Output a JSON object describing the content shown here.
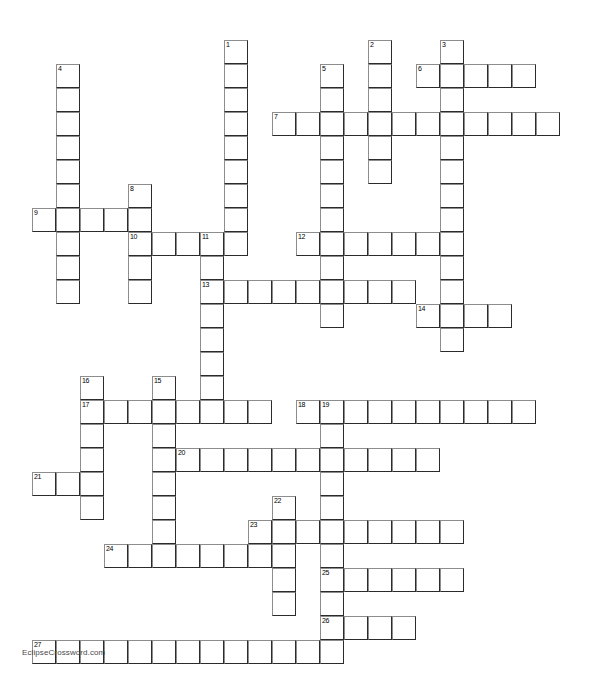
{
  "puzzle": {
    "title": "Crossword Puzzle Grid",
    "watermark": "EclipseCrossword.com",
    "cell_size": 24,
    "origin_x": 32,
    "origin_y": 40,
    "columns": 24,
    "rows": 27,
    "colors": {
      "background": "#ffffff",
      "cell_fill": "#ffffff",
      "cell_border_dark": "#2b2b2b",
      "cell_border_light": "#8d8d8d",
      "number_text": "#000000",
      "watermark_text": "#4a4a4a"
    },
    "entries": [
      {
        "number": 1,
        "direction": "down",
        "col": 8,
        "row": 0,
        "length": 9
      },
      {
        "number": 2,
        "direction": "down",
        "col": 14,
        "row": 0,
        "length": 8
      },
      {
        "number": 3,
        "direction": "down",
        "col": 17,
        "row": 0,
        "length": 11
      },
      {
        "number": 4,
        "direction": "down",
        "col": 1,
        "row": 1,
        "length": 10
      },
      {
        "number": 5,
        "direction": "down",
        "col": 12,
        "row": 1,
        "length": 8
      },
      {
        "number": 6,
        "direction": "across",
        "col": 16,
        "row": 1,
        "length": 5
      },
      {
        "number": 7,
        "direction": "across",
        "col": 10,
        "row": 3,
        "length": 12
      },
      {
        "number": 8,
        "direction": "down",
        "col": 4,
        "row": 6,
        "length": 5
      },
      {
        "number": 9,
        "direction": "across",
        "col": 0,
        "row": 7,
        "length": 5
      },
      {
        "number": 10,
        "direction": "across",
        "col": 4,
        "row": 8,
        "length": 4
      },
      {
        "number": 11,
        "direction": "down",
        "col": 7,
        "row": 8,
        "length": 3
      },
      {
        "number": 12,
        "direction": "across",
        "col": 11,
        "row": 8,
        "length": 7
      },
      {
        "number": 13,
        "direction": "across",
        "col": 7,
        "row": 10,
        "length": 9
      },
      {
        "number": 13,
        "direction": "down",
        "col": 7,
        "row": 10,
        "length": 7
      },
      {
        "number": 14,
        "direction": "across",
        "col": 16,
        "row": 11,
        "length": 4
      },
      {
        "number": 15,
        "direction": "down",
        "col": 5,
        "row": 14,
        "length": 9
      },
      {
        "number": 16,
        "direction": "down",
        "col": 2,
        "row": 14,
        "length": 6
      },
      {
        "number": 17,
        "direction": "across",
        "col": 2,
        "row": 15,
        "length": 8
      },
      {
        "number": 18,
        "direction": "across",
        "col": 11,
        "row": 15,
        "length": 10
      },
      {
        "number": 19,
        "direction": "down",
        "col": 12,
        "row": 15,
        "length": 4
      },
      {
        "number": 20,
        "direction": "across",
        "col": 6,
        "row": 17,
        "length": 11
      },
      {
        "number": 21,
        "direction": "across",
        "col": 0,
        "row": 18,
        "length": 3
      },
      {
        "number": 22,
        "direction": "down",
        "col": 10,
        "row": 19,
        "length": 5
      },
      {
        "number": 23,
        "direction": "across",
        "col": 9,
        "row": 20,
        "length": 9
      },
      {
        "number": 24,
        "direction": "across",
        "col": 3,
        "row": 21,
        "length": 7
      },
      {
        "number": 25,
        "direction": "across",
        "col": 12,
        "row": 22,
        "length": 6
      },
      {
        "number": 26,
        "direction": "across",
        "col": 12,
        "row": 24,
        "length": 4
      },
      {
        "number": 27,
        "direction": "across",
        "col": 0,
        "row": 25,
        "length": 13
      }
    ],
    "cells": [
      {
        "col": 8,
        "row": 0,
        "number": "1"
      },
      {
        "col": 14,
        "row": 0,
        "number": "2"
      },
      {
        "col": 17,
        "row": 0,
        "number": "3"
      },
      {
        "col": 8,
        "row": 1
      },
      {
        "col": 14,
        "row": 1
      },
      {
        "col": 1,
        "row": 1,
        "number": "4"
      },
      {
        "col": 12,
        "row": 1,
        "number": "5"
      },
      {
        "col": 16,
        "row": 1,
        "number": "6"
      },
      {
        "col": 17,
        "row": 1
      },
      {
        "col": 18,
        "row": 1
      },
      {
        "col": 19,
        "row": 1
      },
      {
        "col": 20,
        "row": 1
      },
      {
        "col": 1,
        "row": 2
      },
      {
        "col": 8,
        "row": 2
      },
      {
        "col": 12,
        "row": 2
      },
      {
        "col": 14,
        "row": 2
      },
      {
        "col": 17,
        "row": 2
      },
      {
        "col": 10,
        "row": 3,
        "number": "7"
      },
      {
        "col": 11,
        "row": 3
      },
      {
        "col": 12,
        "row": 3
      },
      {
        "col": 13,
        "row": 3
      },
      {
        "col": 14,
        "row": 3
      },
      {
        "col": 15,
        "row": 3
      },
      {
        "col": 16,
        "row": 3
      },
      {
        "col": 17,
        "row": 3
      },
      {
        "col": 18,
        "row": 3
      },
      {
        "col": 19,
        "row": 3
      },
      {
        "col": 20,
        "row": 3
      },
      {
        "col": 21,
        "row": 3
      },
      {
        "col": 1,
        "row": 3
      },
      {
        "col": 8,
        "row": 3
      },
      {
        "col": 1,
        "row": 4
      },
      {
        "col": 8,
        "row": 4
      },
      {
        "col": 12,
        "row": 4
      },
      {
        "col": 14,
        "row": 4
      },
      {
        "col": 17,
        "row": 4
      },
      {
        "col": 1,
        "row": 5
      },
      {
        "col": 8,
        "row": 5
      },
      {
        "col": 12,
        "row": 5
      },
      {
        "col": 14,
        "row": 5
      },
      {
        "col": 17,
        "row": 5
      },
      {
        "col": 1,
        "row": 6
      },
      {
        "col": 4,
        "row": 6,
        "number": "8"
      },
      {
        "col": 8,
        "row": 6
      },
      {
        "col": 12,
        "row": 6
      },
      {
        "col": 17,
        "row": 6
      },
      {
        "col": 0,
        "row": 7,
        "number": "9"
      },
      {
        "col": 1,
        "row": 7
      },
      {
        "col": 2,
        "row": 7
      },
      {
        "col": 3,
        "row": 7
      },
      {
        "col": 4,
        "row": 7
      },
      {
        "col": 8,
        "row": 7
      },
      {
        "col": 12,
        "row": 7
      },
      {
        "col": 17,
        "row": 7
      },
      {
        "col": 1,
        "row": 8
      },
      {
        "col": 4,
        "row": 8,
        "number": "10"
      },
      {
        "col": 5,
        "row": 8
      },
      {
        "col": 6,
        "row": 8
      },
      {
        "col": 7,
        "row": 8,
        "number": "11"
      },
      {
        "col": 8,
        "row": 8
      },
      {
        "col": 11,
        "row": 8,
        "number": "12"
      },
      {
        "col": 12,
        "row": 8
      },
      {
        "col": 13,
        "row": 8
      },
      {
        "col": 14,
        "row": 8
      },
      {
        "col": 15,
        "row": 8
      },
      {
        "col": 16,
        "row": 8
      },
      {
        "col": 17,
        "row": 8
      },
      {
        "col": 1,
        "row": 9
      },
      {
        "col": 4,
        "row": 9
      },
      {
        "col": 7,
        "row": 9
      },
      {
        "col": 12,
        "row": 9
      },
      {
        "col": 17,
        "row": 9
      },
      {
        "col": 1,
        "row": 10
      },
      {
        "col": 4,
        "row": 10
      },
      {
        "col": 7,
        "row": 10,
        "number": "13"
      },
      {
        "col": 8,
        "row": 10
      },
      {
        "col": 9,
        "row": 10
      },
      {
        "col": 10,
        "row": 10
      },
      {
        "col": 11,
        "row": 10
      },
      {
        "col": 12,
        "row": 10
      },
      {
        "col": 13,
        "row": 10
      },
      {
        "col": 14,
        "row": 10
      },
      {
        "col": 15,
        "row": 10
      },
      {
        "col": 17,
        "row": 10
      },
      {
        "col": 7,
        "row": 11
      },
      {
        "col": 12,
        "row": 11
      },
      {
        "col": 16,
        "row": 11,
        "number": "14"
      },
      {
        "col": 17,
        "row": 11
      },
      {
        "col": 18,
        "row": 11
      },
      {
        "col": 19,
        "row": 11
      },
      {
        "col": 7,
        "row": 12
      },
      {
        "col": 17,
        "row": 12
      },
      {
        "col": 7,
        "row": 13
      },
      {
        "col": 7,
        "row": 14
      },
      {
        "col": 5,
        "row": 14,
        "number": "15"
      },
      {
        "col": 2,
        "row": 14,
        "number": "16"
      },
      {
        "col": 2,
        "row": 15,
        "number": "17"
      },
      {
        "col": 3,
        "row": 15
      },
      {
        "col": 4,
        "row": 15
      },
      {
        "col": 5,
        "row": 15
      },
      {
        "col": 6,
        "row": 15
      },
      {
        "col": 7,
        "row": 15
      },
      {
        "col": 8,
        "row": 15
      },
      {
        "col": 9,
        "row": 15
      },
      {
        "col": 11,
        "row": 15,
        "number": "18"
      },
      {
        "col": 12,
        "row": 15,
        "number": "19"
      },
      {
        "col": 13,
        "row": 15
      },
      {
        "col": 14,
        "row": 15
      },
      {
        "col": 15,
        "row": 15
      },
      {
        "col": 16,
        "row": 15
      },
      {
        "col": 17,
        "row": 15
      },
      {
        "col": 18,
        "row": 15
      },
      {
        "col": 19,
        "row": 15
      },
      {
        "col": 20,
        "row": 15
      },
      {
        "col": 2,
        "row": 16
      },
      {
        "col": 5,
        "row": 16
      },
      {
        "col": 12,
        "row": 16
      },
      {
        "col": 2,
        "row": 17
      },
      {
        "col": 5,
        "row": 17
      },
      {
        "col": 6,
        "row": 17,
        "number": "20"
      },
      {
        "col": 7,
        "row": 17
      },
      {
        "col": 8,
        "row": 17
      },
      {
        "col": 9,
        "row": 17
      },
      {
        "col": 10,
        "row": 17
      },
      {
        "col": 11,
        "row": 17
      },
      {
        "col": 12,
        "row": 17
      },
      {
        "col": 13,
        "row": 17
      },
      {
        "col": 14,
        "row": 17
      },
      {
        "col": 15,
        "row": 17
      },
      {
        "col": 16,
        "row": 17
      },
      {
        "col": 0,
        "row": 18,
        "number": "21"
      },
      {
        "col": 1,
        "row": 18
      },
      {
        "col": 2,
        "row": 18
      },
      {
        "col": 5,
        "row": 18
      },
      {
        "col": 12,
        "row": 18
      },
      {
        "col": 2,
        "row": 19
      },
      {
        "col": 5,
        "row": 19
      },
      {
        "col": 10,
        "row": 19,
        "number": "22"
      },
      {
        "col": 12,
        "row": 19
      },
      {
        "col": 5,
        "row": 20
      },
      {
        "col": 9,
        "row": 20,
        "number": "23"
      },
      {
        "col": 10,
        "row": 20
      },
      {
        "col": 11,
        "row": 20
      },
      {
        "col": 12,
        "row": 20
      },
      {
        "col": 13,
        "row": 20
      },
      {
        "col": 14,
        "row": 20
      },
      {
        "col": 15,
        "row": 20
      },
      {
        "col": 16,
        "row": 20
      },
      {
        "col": 17,
        "row": 20
      },
      {
        "col": 3,
        "row": 21,
        "number": "24"
      },
      {
        "col": 4,
        "row": 21
      },
      {
        "col": 5,
        "row": 21
      },
      {
        "col": 6,
        "row": 21
      },
      {
        "col": 7,
        "row": 21
      },
      {
        "col": 8,
        "row": 21
      },
      {
        "col": 9,
        "row": 21
      },
      {
        "col": 10,
        "row": 21
      },
      {
        "col": 12,
        "row": 21
      },
      {
        "col": 10,
        "row": 22
      },
      {
        "col": 12,
        "row": 22,
        "number": "25"
      },
      {
        "col": 13,
        "row": 22
      },
      {
        "col": 14,
        "row": 22
      },
      {
        "col": 15,
        "row": 22
      },
      {
        "col": 16,
        "row": 22
      },
      {
        "col": 17,
        "row": 22
      },
      {
        "col": 10,
        "row": 23
      },
      {
        "col": 12,
        "row": 23
      },
      {
        "col": 12,
        "row": 24,
        "number": "26"
      },
      {
        "col": 13,
        "row": 24
      },
      {
        "col": 14,
        "row": 24
      },
      {
        "col": 15,
        "row": 24
      },
      {
        "col": 0,
        "row": 25,
        "number": "27"
      },
      {
        "col": 1,
        "row": 25
      },
      {
        "col": 2,
        "row": 25
      },
      {
        "col": 3,
        "row": 25
      },
      {
        "col": 4,
        "row": 25
      },
      {
        "col": 5,
        "row": 25
      },
      {
        "col": 6,
        "row": 25
      },
      {
        "col": 7,
        "row": 25
      },
      {
        "col": 8,
        "row": 25
      },
      {
        "col": 9,
        "row": 25
      },
      {
        "col": 10,
        "row": 25
      },
      {
        "col": 11,
        "row": 25
      },
      {
        "col": 12,
        "row": 25
      }
    ]
  }
}
